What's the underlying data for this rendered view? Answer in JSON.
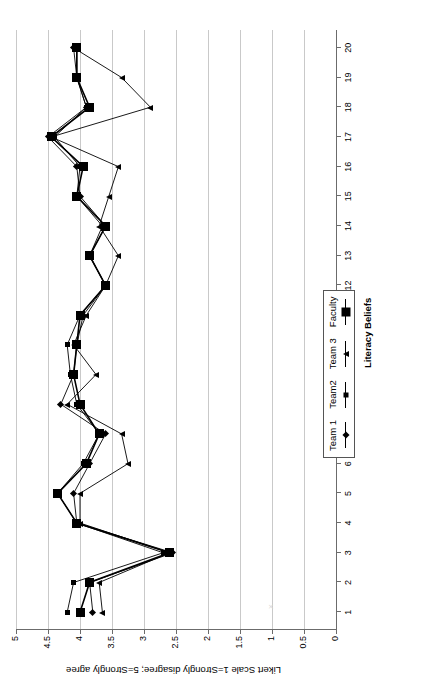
{
  "figure": {
    "orientation": "rotated-90-ccw",
    "background": "#ffffff",
    "line_color": "#000000",
    "grid_color": "#c9c9c9",
    "axis_color": "#6b6b6b"
  },
  "legend": {
    "position": "top-right",
    "entries": [
      {
        "label": "Team 1",
        "marker": "diamond-icon"
      },
      {
        "label": "Team2",
        "marker": "square-small-icon"
      },
      {
        "label": "Team 3",
        "marker": "triangle-icon"
      },
      {
        "label": "Faculty",
        "marker": "square-large-icon"
      }
    ]
  },
  "chart_data": {
    "type": "line",
    "title": "",
    "xlabel": "Literacy Beliefs",
    "ylabel": "Likert Scale 1=Strongly disagree; 5=Strongly agree",
    "x": [
      1,
      2,
      3,
      4,
      5,
      6,
      7,
      8,
      9,
      10,
      11,
      12,
      13,
      14,
      15,
      16,
      17,
      18,
      19,
      20
    ],
    "xtick_labels": [
      "1",
      "2",
      "3",
      "4",
      "5",
      "6",
      "7",
      "8",
      "9",
      "10",
      "11",
      "12",
      "13",
      "14",
      "15",
      "16",
      "17",
      "18",
      "19",
      "20"
    ],
    "ytick_labels": [
      "0",
      "0.5",
      "1",
      "1.5",
      "2",
      "2.5",
      "3",
      "3.5",
      "4",
      "4.5",
      "5"
    ],
    "ylim": [
      0,
      5
    ],
    "ytick_step": 0.5,
    "xlim": [
      0.4,
      20.6
    ],
    "grid": "y-gridlines-only",
    "legend_position": "top-right",
    "series": [
      {
        "name": "Team 1",
        "marker": "diamond",
        "values": [
          3.8,
          3.85,
          2.55,
          4.05,
          4.1,
          3.85,
          3.6,
          4.3,
          4.1,
          4.05,
          3.95,
          3.6,
          3.85,
          3.6,
          4.0,
          4.05,
          4.5,
          3.9,
          4.05,
          4.1
        ]
      },
      {
        "name": "Team2",
        "marker": "square-small",
        "values": [
          4.2,
          4.1,
          2.7,
          4.05,
          4.35,
          3.95,
          3.7,
          4.05,
          4.15,
          4.2,
          4.0,
          3.6,
          3.85,
          3.65,
          4.05,
          4.0,
          4.4,
          3.9,
          4.05,
          4.05
        ]
      },
      {
        "name": "Team 3",
        "marker": "triangle",
        "values": [
          3.65,
          3.7,
          2.6,
          4.0,
          4.0,
          3.25,
          3.35,
          4.2,
          3.75,
          4.1,
          3.9,
          3.6,
          3.4,
          3.7,
          3.55,
          3.4,
          4.45,
          2.9,
          3.35,
          4.1
        ]
      },
      {
        "name": "Faculty",
        "marker": "square-large",
        "values": [
          4.0,
          3.85,
          2.6,
          4.05,
          4.35,
          3.9,
          3.7,
          4.0,
          4.1,
          4.05,
          4.0,
          3.6,
          3.85,
          3.6,
          4.05,
          3.95,
          4.45,
          3.85,
          4.05,
          4.05
        ]
      }
    ]
  }
}
